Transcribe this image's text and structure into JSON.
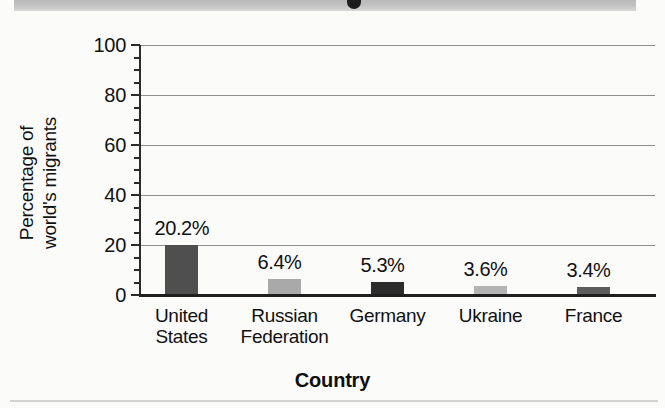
{
  "chart_data": {
    "type": "bar",
    "title": "",
    "subtitle": "",
    "xlabel": "Country",
    "ylabel": "Percentage of world's migrants",
    "ylabel_lines": [
      "Percentage of",
      "world's migrants"
    ],
    "categories": [
      "United States",
      "Russian Federation",
      "Germany",
      "Ukraine",
      "France"
    ],
    "category_lines": [
      [
        "United",
        "States"
      ],
      [
        "Russian",
        "Federation"
      ],
      [
        "Germany"
      ],
      [
        "Ukraine"
      ],
      [
        "France"
      ]
    ],
    "values": [
      20.2,
      6.4,
      5.3,
      3.6,
      3.4
    ],
    "data_labels": [
      "20.2%",
      "6.4%",
      "5.3%",
      "3.6%",
      "3.4%"
    ],
    "bar_colors": [
      "#4f4f4f",
      "#a9a9a9",
      "#2c2c2c",
      "#b4b4b4",
      "#5c5c5c"
    ],
    "ylim": [
      0,
      100
    ],
    "yticks": [
      0,
      20,
      40,
      60,
      80,
      100
    ],
    "ytick_labels": [
      "0",
      "20",
      "40",
      "60",
      "80",
      "100"
    ],
    "yminor_step": 5,
    "grid": true,
    "grid_axis": "y",
    "grid_color": "#8f8f8f",
    "legend": false,
    "legend_position": "none",
    "axis_color": "#2b2b2b",
    "background": "#fbfbfa"
  }
}
